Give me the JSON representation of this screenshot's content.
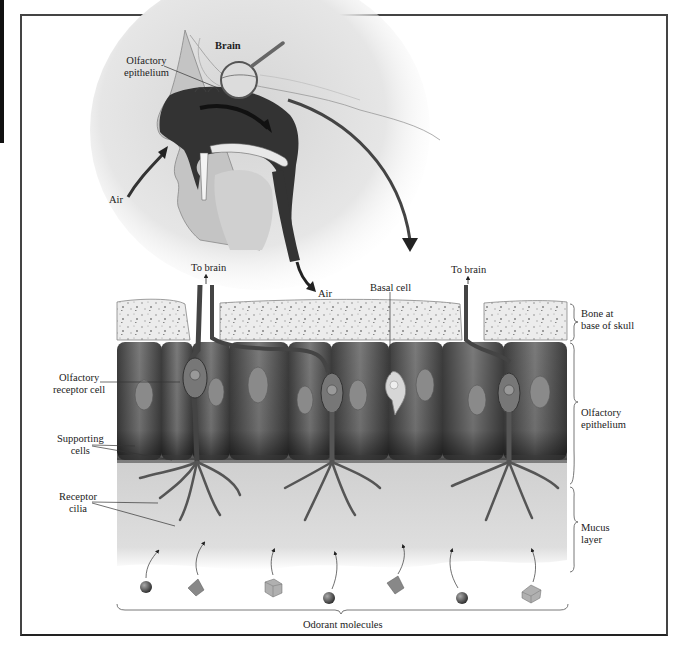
{
  "figure": {
    "head_section": {
      "labels": {
        "brain": "Brain",
        "olfactory_epithelium": "Olfactory\nepithelium",
        "air_in": "Air",
        "air_out": "Air"
      }
    },
    "tissue_section": {
      "top_labels": {
        "to_brain_left": "To brain",
        "to_brain_right": "To brain",
        "basal_cell": "Basal cell"
      },
      "left_labels": {
        "olfactory_receptor_cell": "Olfactory\nreceptor cell",
        "supporting_cells": "Supporting\ncells",
        "receptor_cilia": "Receptor\ncilia"
      },
      "right_labels": {
        "bone": "Bone at\nbase of skull",
        "olfactory_epithelium": "Olfactory\nepithelium",
        "mucus_layer": "Mucus\nlayer"
      },
      "bottom_label": "Odorant molecules",
      "molecules": [
        {
          "shape": "sphere",
          "x": 146,
          "y": 587
        },
        {
          "shape": "pyramid",
          "x": 196,
          "y": 588
        },
        {
          "shape": "cube",
          "x": 272,
          "y": 587
        },
        {
          "shape": "sphere",
          "x": 329,
          "y": 598
        },
        {
          "shape": "pyramid",
          "x": 396,
          "y": 584
        },
        {
          "shape": "sphere",
          "x": 462,
          "y": 598
        },
        {
          "shape": "cube",
          "x": 532,
          "y": 593
        }
      ]
    },
    "colors": {
      "ink": "#222222",
      "cell_dark": "#3a3a3a",
      "cell_mid": "#6e6e6e",
      "bone_fill": "#ebebeb",
      "mucus": "#d6d6d6",
      "skin": "#c8c8c8",
      "cavity": "#2e2e2e"
    }
  }
}
